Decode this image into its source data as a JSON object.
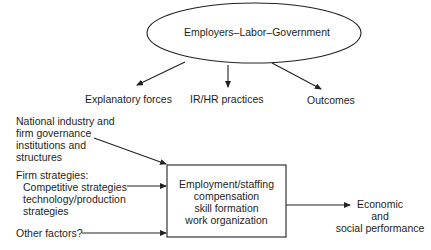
{
  "ellipse": {
    "label": "Employers–Labor–Government"
  },
  "branches": [
    {
      "label": "Explanatory forces"
    },
    {
      "label": "IR/HR practices"
    },
    {
      "label": "Outcomes"
    }
  ],
  "inputs": {
    "national": [
      "National industry and",
      "firm governance",
      "institutions and",
      "structures"
    ],
    "firm_heading": "Firm strategies:",
    "firm": [
      "Competitive strategies",
      "technology/production",
      "strategies"
    ],
    "other": "Other factors?"
  },
  "box": {
    "lines": [
      "Employment/staffing",
      "compensation",
      "skill formation",
      "work organization"
    ]
  },
  "output": {
    "lines": [
      "Economic",
      "and",
      "social performance"
    ]
  }
}
